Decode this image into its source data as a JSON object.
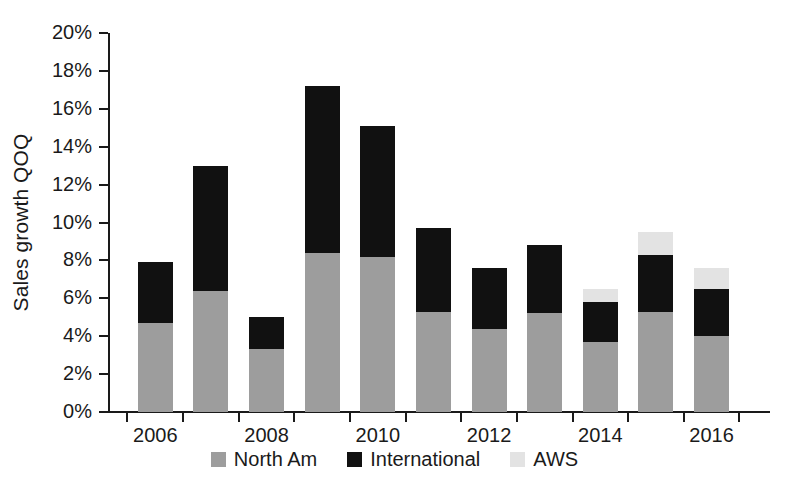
{
  "chart_data": {
    "type": "bar",
    "stacked": true,
    "title": "",
    "xlabel": "",
    "ylabel": "Sales growth QOQ",
    "ylim": [
      0,
      20
    ],
    "ytick_values": [
      0,
      2,
      4,
      6,
      8,
      10,
      12,
      14,
      16,
      18,
      20
    ],
    "ytick_labels": [
      "0%",
      "2%",
      "4%",
      "6%",
      "8%",
      "10%",
      "12%",
      "14%",
      "16%",
      "18%",
      "20%"
    ],
    "categories": [
      "2006",
      "2007",
      "2008",
      "2009",
      "2010",
      "2011",
      "2012",
      "2013",
      "2014",
      "2015",
      "2016"
    ],
    "xtick_labels_shown": [
      "2006",
      "",
      "2008",
      "",
      "2010",
      "",
      "2012",
      "",
      "2014",
      "",
      "2016"
    ],
    "grid": false,
    "legend_position": "bottom",
    "series": [
      {
        "name": "North Am",
        "color": "#9d9d9d",
        "values": [
          4.7,
          6.4,
          3.3,
          8.4,
          8.2,
          5.3,
          4.4,
          5.2,
          3.7,
          5.3,
          4.0
        ]
      },
      {
        "name": "International",
        "color": "#111111",
        "values": [
          3.2,
          6.6,
          1.7,
          8.8,
          6.9,
          4.4,
          3.2,
          3.6,
          2.1,
          3.0,
          2.5
        ]
      },
      {
        "name": "AWS",
        "color": "#e3e3e3",
        "values": [
          0,
          0,
          0,
          0,
          0,
          0,
          0,
          0,
          0.7,
          1.2,
          1.1
        ]
      }
    ],
    "totals": [
      7.9,
      13.0,
      5.0,
      17.2,
      15.1,
      9.7,
      7.6,
      8.8,
      6.5,
      9.5,
      7.6
    ]
  },
  "legend": {
    "items": [
      {
        "label": "North Am",
        "color": "#9d9d9d"
      },
      {
        "label": "International",
        "color": "#111111"
      },
      {
        "label": "AWS",
        "color": "#e3e3e3"
      }
    ]
  }
}
